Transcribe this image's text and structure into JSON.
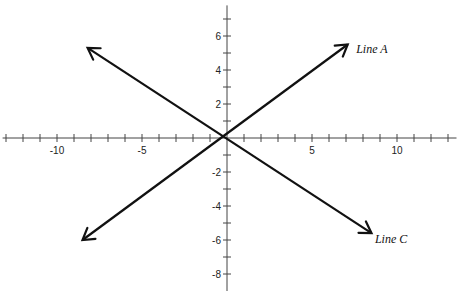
{
  "chart_data": {
    "type": "line",
    "title": "",
    "xlabel": "",
    "ylabel": "",
    "xlim": [
      -13.2,
      13.5
    ],
    "ylim": [
      -9,
      7.8
    ],
    "grid": false,
    "x_ticks": [
      -13,
      -12,
      -11,
      -10,
      -9,
      -8,
      -7,
      -6,
      -5,
      -4,
      -3,
      -2,
      -1,
      1,
      2,
      3,
      4,
      5,
      6,
      7,
      8,
      9,
      10,
      11,
      12,
      13
    ],
    "x_tick_labels": [
      {
        "value": -10,
        "label": "-10"
      },
      {
        "value": -5,
        "label": "-5"
      },
      {
        "value": 5,
        "label": "5"
      },
      {
        "value": 10,
        "label": "10"
      }
    ],
    "y_ticks": [
      7,
      6,
      5,
      4,
      3,
      2,
      1,
      -1,
      -2,
      -3,
      -4,
      -5,
      -6,
      -7,
      -8
    ],
    "y_tick_labels": [
      {
        "value": 6,
        "label": "6"
      },
      {
        "value": 4,
        "label": "4"
      },
      {
        "value": 2,
        "label": "2"
      },
      {
        "value": -2,
        "label": "-2"
      },
      {
        "value": -4,
        "label": "-4"
      },
      {
        "value": -6,
        "label": "-6"
      },
      {
        "value": -8,
        "label": "-8"
      }
    ],
    "series": [
      {
        "name": "Line A",
        "x": [
          -8.5,
          7.1
        ],
        "y": [
          -6.0,
          5.5
        ],
        "arrows": "both",
        "label_position": {
          "x": 7.6,
          "y": 5.0
        }
      },
      {
        "name": "Line C",
        "x": [
          -8.2,
          8.5
        ],
        "y": [
          5.3,
          -5.6
        ],
        "arrows": "both",
        "label_position": {
          "x": 8.7,
          "y": -6.2
        }
      }
    ],
    "legend": "inline labels at arrow ends"
  },
  "layout": {
    "origin_px": {
      "x": 227,
      "y": 138
    },
    "unit_px": 17,
    "line_color": "#111111",
    "axis_color": "#444444"
  }
}
